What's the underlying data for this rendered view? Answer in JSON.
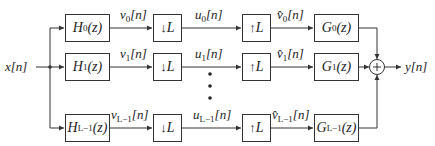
{
  "diagram": {
    "type": "filter-bank block diagram",
    "input": {
      "label": "x[n]"
    },
    "output": {
      "label": "y[n]"
    },
    "channels": [
      {
        "analysis_filter": {
          "name": "H",
          "sub": "0",
          "arg": "(z)"
        },
        "analysis_output": {
          "name": "v",
          "sub": "0",
          "arg": "[n]"
        },
        "decimator": {
          "symbol": "↓",
          "factor": "L"
        },
        "decimated": {
          "name": "u",
          "sub": "0",
          "arg": "[n]"
        },
        "expander": {
          "symbol": "↑",
          "factor": "L"
        },
        "expanded": {
          "name": "v̂",
          "sub": "0",
          "arg": "[n]"
        },
        "synthesis_filter": {
          "name": "G",
          "sub": "0",
          "arg": "(z)"
        }
      },
      {
        "analysis_filter": {
          "name": "H",
          "sub": "1",
          "arg": "(z)"
        },
        "analysis_output": {
          "name": "v",
          "sub": "1",
          "arg": "[n]"
        },
        "decimator": {
          "symbol": "↓",
          "factor": "L"
        },
        "decimated": {
          "name": "u",
          "sub": "1",
          "arg": "[n]"
        },
        "expander": {
          "symbol": "↑",
          "factor": "L"
        },
        "expanded": {
          "name": "v̂",
          "sub": "1",
          "arg": "[n]"
        },
        "synthesis_filter": {
          "name": "G",
          "sub": "1",
          "arg": "(z)"
        }
      },
      {
        "analysis_filter": {
          "name": "H",
          "sub": "L−1",
          "arg": "(z)"
        },
        "analysis_output": {
          "name": "v",
          "sub": "L−1",
          "arg": "[n]"
        },
        "decimator": {
          "symbol": "↓",
          "factor": "L"
        },
        "decimated": {
          "name": "u",
          "sub": "L−1",
          "arg": "[n]"
        },
        "expander": {
          "symbol": "↑",
          "factor": "L"
        },
        "expanded": {
          "name": "v̂",
          "sub": "L−1",
          "arg": "[n]"
        },
        "synthesis_filter": {
          "name": "G",
          "sub": "L−1",
          "arg": "(z)"
        }
      }
    ],
    "summer": {
      "symbol": "+"
    },
    "ellipsis": "⋮",
    "colors": {
      "line": "#333333",
      "text": "#222222",
      "background": "#ffffff"
    }
  }
}
